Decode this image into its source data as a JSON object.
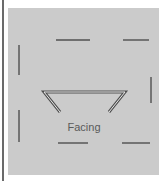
{
  "diagram": {
    "label": "Facing",
    "colors": {
      "background": "#ffffff",
      "panel": "#cbcbcb",
      "line": "#505050",
      "line_highlight": "#e8e8e8",
      "edge": "#6a6a6a",
      "text": "#5a5a5a"
    }
  }
}
